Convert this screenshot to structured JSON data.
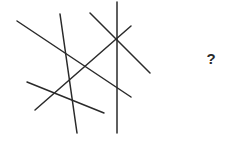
{
  "puzzle": {
    "question_mark": "?",
    "line_color": "#2a2a2a",
    "line_count": 6,
    "lines": [
      {
        "x1": 17,
        "y1": 21,
        "x2": 131,
        "y2": 97
      },
      {
        "x1": 60,
        "y1": 14,
        "x2": 77,
        "y2": 133
      },
      {
        "x1": 90,
        "y1": 13,
        "x2": 150,
        "y2": 73
      },
      {
        "x1": 117,
        "y1": 2,
        "x2": 117,
        "y2": 133
      },
      {
        "x1": 35,
        "y1": 110,
        "x2": 131,
        "y2": 26
      },
      {
        "x1": 27,
        "y1": 82,
        "x2": 104,
        "y2": 113
      }
    ]
  }
}
